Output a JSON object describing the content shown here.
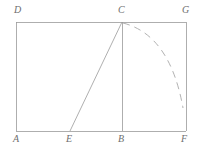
{
  "figure": {
    "type": "geometry-diagram",
    "canvas": {
      "width": 203,
      "height": 149
    },
    "style": {
      "background_color": "#ffffff",
      "line_color": "#9a9a9a",
      "dash_color": "#a8a8a8",
      "label_color": "#6e6e6e",
      "line_width": 0.8,
      "label_font_size": 10
    },
    "points": [
      {
        "id": "A",
        "label": "A",
        "x": 16,
        "y": 131,
        "label_x": 13,
        "label_y": 134
      },
      {
        "id": "E",
        "label": "E",
        "x": 70,
        "y": 131,
        "label_x": 66,
        "label_y": 134
      },
      {
        "id": "B",
        "label": "B",
        "x": 122,
        "y": 131,
        "label_x": 118,
        "label_y": 134
      },
      {
        "id": "F",
        "label": "F",
        "x": 186,
        "y": 131,
        "label_x": 181,
        "label_y": 134
      },
      {
        "id": "D",
        "label": "D",
        "x": 16,
        "y": 22,
        "label_x": 14,
        "label_y": 5
      },
      {
        "id": "C",
        "label": "C",
        "x": 122,
        "y": 22,
        "label_x": 118,
        "label_y": 5
      },
      {
        "id": "G",
        "label": "G",
        "x": 186,
        "y": 22,
        "label_x": 182,
        "label_y": 5
      }
    ],
    "segments": [
      {
        "id": "AD",
        "name": "left-side",
        "from": "A",
        "to": "D",
        "x1": 16,
        "y1": 131,
        "x2": 16,
        "y2": 22,
        "style": "solid"
      },
      {
        "id": "DG",
        "name": "top-side",
        "from": "D",
        "to": "G",
        "x1": 16,
        "y1": 22,
        "x2": 186,
        "y2": 22,
        "style": "solid"
      },
      {
        "id": "GF",
        "name": "right-side",
        "from": "G",
        "to": "F",
        "x1": 186,
        "y1": 22,
        "x2": 186,
        "y2": 131,
        "style": "solid"
      },
      {
        "id": "FA",
        "name": "bottom-side",
        "from": "F",
        "to": "A",
        "x1": 186,
        "y1": 131,
        "x2": 16,
        "y2": 131,
        "style": "solid"
      },
      {
        "id": "CB",
        "name": "altitude-cb",
        "from": "C",
        "to": "B",
        "x1": 122,
        "y1": 22,
        "x2": 122,
        "y2": 131,
        "style": "solid"
      },
      {
        "id": "EC",
        "name": "segment-ec",
        "from": "E",
        "to": "C",
        "x1": 70,
        "y1": 131,
        "x2": 122,
        "y2": 22,
        "style": "solid"
      }
    ],
    "arcs": [
      {
        "id": "CF-arc",
        "name": "dashed-arc-c-to-f",
        "style": "dashed",
        "dash_pattern": "7 5",
        "from": "C",
        "to_near": "F",
        "path": "M 123 23 Q 170 35 183 108",
        "start_x": 123,
        "start_y": 23,
        "control_x": 170,
        "control_y": 35,
        "end_x": 183,
        "end_y": 108
      }
    ]
  }
}
